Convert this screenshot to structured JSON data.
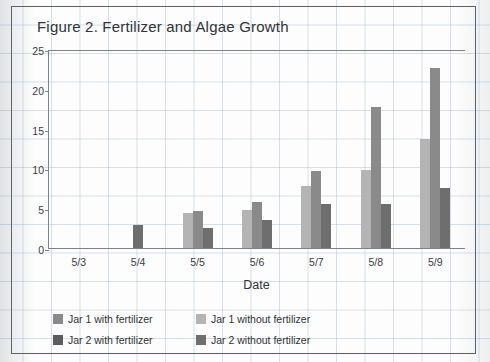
{
  "figure": {
    "title": "Figure 2. Fertilizer and Algae Growth"
  },
  "axes": {
    "ylabel": "Diameter of algae (mm)",
    "xlabel": "Date",
    "yticks": [
      "25",
      "20",
      "15",
      "10",
      "5",
      "0"
    ]
  },
  "legend": {
    "items": [
      {
        "label": "Jar 1 with fertilizer",
        "color": "#8a8a8a"
      },
      {
        "label": "Jar 1 without fertilizer",
        "color": "#b4b4b4"
      },
      {
        "label": "Jar 2 with fertilizer",
        "color": "#5d5d5d"
      },
      {
        "label": "Jar 2 without fertilizer",
        "color": "#6e6e6e"
      }
    ]
  },
  "chart_data": {
    "type": "bar",
    "title": "Figure 2. Fertilizer and Algae Growth",
    "xlabel": "Date",
    "ylabel": "Diameter of algae (mm)",
    "ylim": [
      0,
      25
    ],
    "ytick_step": 5,
    "grid": false,
    "legend_position": "bottom-left",
    "categories": [
      "5/3",
      "5/4",
      "5/5",
      "5/6",
      "5/7",
      "5/8",
      "5/9"
    ],
    "series": [
      {
        "name": "Jar 1 without fertilizer",
        "color": "#b4b4b4",
        "values": [
          0,
          0,
          4.4,
          4.8,
          7.8,
          9.8,
          13.7
        ]
      },
      {
        "name": "Jar 1 with fertilizer",
        "color": "#8a8a8a",
        "values": [
          0,
          0,
          4.6,
          5.8,
          9.7,
          17.7,
          22.6
        ]
      },
      {
        "name": "Jar 2 without fertilizer",
        "color": "#6e6e6e",
        "values": [
          0,
          2.9,
          2.5,
          3.5,
          5.5,
          5.5,
          7.6
        ]
      },
      {
        "name": "Jar 2 with fertilizer",
        "color": "#5d5d5d",
        "values": [
          0,
          0,
          0,
          0,
          0,
          0,
          0
        ]
      }
    ]
  }
}
